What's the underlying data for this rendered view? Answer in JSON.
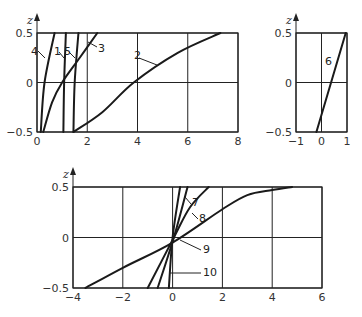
{
  "chart_data": [
    {
      "id": "top-left",
      "type": "line",
      "title": "",
      "xlabel": "",
      "ylabel": "z",
      "xlim": [
        0,
        8
      ],
      "ylim": [
        -0.5,
        0.5
      ],
      "x_ticks": [
        "0",
        "2",
        "4",
        "6",
        "8"
      ],
      "y_ticks": [
        "0.5",
        "0",
        "-0.5"
      ],
      "grid": true,
      "series": [
        {
          "name": "1",
          "points": [
            [
              1.05,
              -0.5
            ],
            [
              1.08,
              0.0
            ],
            [
              1.15,
              0.5
            ]
          ]
        },
        {
          "name": "2",
          "points": [
            [
              1.45,
              -0.5
            ],
            [
              2.6,
              -0.3
            ],
            [
              3.85,
              0.0
            ],
            [
              5.6,
              0.3
            ],
            [
              7.3,
              0.5
            ]
          ]
        },
        {
          "name": "3",
          "points": [
            [
              0.25,
              -0.5
            ],
            [
              0.6,
              -0.2
            ],
            [
              1.0,
              0.0
            ],
            [
              1.7,
              0.25
            ],
            [
              2.4,
              0.5
            ]
          ]
        },
        {
          "name": "4",
          "points": [
            [
              0.15,
              -0.5
            ],
            [
              0.3,
              0.0
            ],
            [
              0.7,
              0.5
            ]
          ]
        },
        {
          "name": "5",
          "points": [
            [
              1.45,
              -0.5
            ],
            [
              1.5,
              0.0
            ],
            [
              1.65,
              0.5
            ]
          ]
        }
      ]
    },
    {
      "id": "top-right",
      "type": "line",
      "title": "",
      "xlabel": "",
      "ylabel": "z",
      "xlim": [
        -1,
        1
      ],
      "ylim": [
        -0.5,
        0.5
      ],
      "x_ticks": [
        "-1",
        "0",
        "1"
      ],
      "y_ticks": [
        "0.5",
        "0",
        "-0.5"
      ],
      "grid": true,
      "series": [
        {
          "name": "6",
          "points": [
            [
              -0.2,
              -0.5
            ],
            [
              0.95,
              0.5
            ]
          ]
        }
      ]
    },
    {
      "id": "bottom",
      "type": "line",
      "title": "",
      "xlabel": "",
      "ylabel": "z",
      "xlim": [
        -4,
        6
      ],
      "ylim": [
        -0.5,
        0.5
      ],
      "x_ticks": [
        "-4",
        "-2",
        "0",
        "2",
        "4",
        "6"
      ],
      "y_ticks": [
        "0.5",
        "0",
        "-0.5"
      ],
      "grid": true,
      "series": [
        {
          "name": "7",
          "points": [
            [
              -0.6,
              -0.5
            ],
            [
              0.05,
              0.0
            ],
            [
              0.6,
              0.5
            ]
          ]
        },
        {
          "name": "8",
          "points": [
            [
              -1.0,
              -0.5
            ],
            [
              0.05,
              0.0
            ],
            [
              0.7,
              0.3
            ],
            [
              1.45,
              0.5
            ]
          ]
        },
        {
          "name": "9",
          "points": [
            [
              -3.5,
              -0.5
            ],
            [
              -2.0,
              -0.3
            ],
            [
              0.0,
              -0.05
            ],
            [
              2.0,
              0.28
            ],
            [
              3.0,
              0.42
            ],
            [
              4.0,
              0.47
            ],
            [
              4.8,
              0.5
            ]
          ]
        },
        {
          "name": "10",
          "points": [
            [
              -0.15,
              -0.5
            ],
            [
              0.0,
              0.0
            ],
            [
              0.3,
              0.5
            ]
          ]
        }
      ]
    }
  ],
  "labels": {
    "z": "z",
    "c1": "1",
    "c2": "2",
    "c3": "3",
    "c4": "4",
    "c5": "5",
    "c6": "6",
    "c7": "7",
    "c8": "8",
    "c9": "9",
    "c10": "10"
  }
}
